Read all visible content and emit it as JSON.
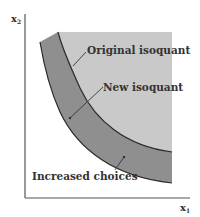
{
  "diagram": {
    "axes": {
      "y_label": "x",
      "y_sub": "2",
      "x_label": "x",
      "x_sub": "1"
    },
    "labels": {
      "original": "Original isoquant",
      "new": "New isoquant",
      "increased": "Increased choices"
    },
    "colors": {
      "light_region": "#c9c9c9",
      "dark_band": "#8f8f8f",
      "curve": "#2a2a2a",
      "axis": "#555555",
      "text": "#333333"
    }
  }
}
